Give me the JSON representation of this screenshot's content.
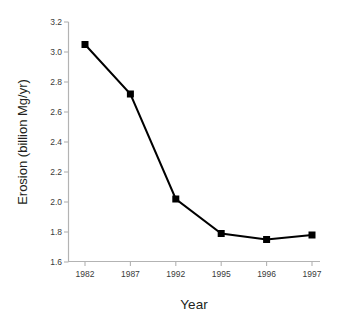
{
  "chart_data": {
    "type": "line",
    "title": "",
    "subtitle": "",
    "xlabel": "Year",
    "ylabel": "Erosion (billion Mg/yr)",
    "categories": [
      "1982",
      "1987",
      "1992",
      "1995",
      "1996",
      "1997"
    ],
    "values": [
      3.05,
      2.72,
      2.02,
      1.79,
      1.75,
      1.78
    ],
    "series": [
      {
        "name": "Erosion",
        "values": [
          3.05,
          2.72,
          2.02,
          1.79,
          1.75,
          1.78
        ]
      }
    ],
    "ylim": [
      1.6,
      3.2
    ],
    "ytick_labels": [
      "3.2",
      "3.0",
      "2.8",
      "2.6",
      "2.4",
      "2.2",
      "2.0",
      "1.8",
      "1.6"
    ],
    "ytick_values": [
      3.2,
      3.0,
      2.8,
      2.6,
      2.4,
      2.2,
      2.0,
      1.8,
      1.6
    ],
    "grid": false,
    "legend": false,
    "legend_position": "none",
    "annotations": [],
    "marker": "filled-square",
    "line_color": "#000000",
    "marker_color": "#000000",
    "axis_color": "#b3b3b3",
    "text_color": "#231f20",
    "background_color": "#ffffff"
  }
}
